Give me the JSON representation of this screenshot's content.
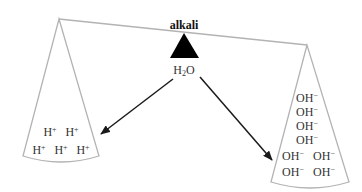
{
  "diagram": {
    "title": "alkali",
    "fulcrum_label": "H₂O",
    "fulcrum_label_parts": {
      "base": "H",
      "sub": "2",
      "tail": "O"
    },
    "left_pan": {
      "ion": "H",
      "charge": "+",
      "rows": [
        {
          "items": [
            "H⁺",
            "H⁺"
          ]
        },
        {
          "items": [
            "H⁺",
            "H⁺",
            "H⁺"
          ]
        }
      ]
    },
    "right_pan": {
      "ion": "OH",
      "charge": "−",
      "rows": [
        {
          "items": [
            "OH⁻"
          ]
        },
        {
          "items": [
            "OH⁻"
          ]
        },
        {
          "items": [
            "OH⁻"
          ]
        },
        {
          "items": [
            "OH⁻"
          ]
        },
        {
          "items": [
            "OH⁻",
            "OH⁻"
          ]
        },
        {
          "items": [
            "OH⁻",
            "OH⁻"
          ]
        }
      ]
    },
    "arrows": [
      {
        "from": "H₂O",
        "to": "left_pan"
      },
      {
        "from": "H₂O",
        "to": "right_pan"
      }
    ],
    "colors": {
      "beam": "#b3b3b3",
      "fulcrum": "#000000",
      "arrow": "#1a1a1a",
      "text": "#333333"
    }
  }
}
